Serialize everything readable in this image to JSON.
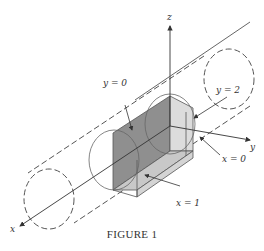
{
  "figure": {
    "caption": "FIGURE 1",
    "axes": {
      "x": "x",
      "y": "y",
      "z": "z"
    },
    "labels": {
      "y0": "y = 0",
      "y2": "y = 2",
      "x0": "x = 0",
      "x1": "x = 1"
    },
    "colors": {
      "line": "#444444",
      "dark_face": "#8f8f8f",
      "light_face": "#c8c8c8",
      "lighter_face": "#dcdcdc"
    }
  }
}
